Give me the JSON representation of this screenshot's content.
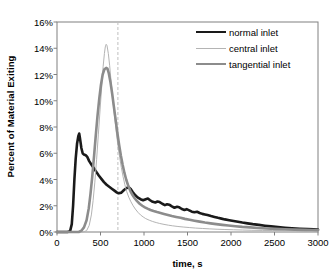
{
  "chart_data": {
    "type": "line",
    "title": "",
    "xlabel": "time, s",
    "ylabel": "Percent of Material Exiting",
    "xlim": [
      0,
      3000
    ],
    "ylim": [
      0,
      16
    ],
    "xticks": [
      "0",
      "500",
      "1000",
      "1500",
      "2000",
      "2500",
      "3000"
    ],
    "xtick_values": [
      0,
      500,
      1000,
      1500,
      2000,
      2500,
      3000
    ],
    "yticks": [
      "0%",
      "2%",
      "4%",
      "6%",
      "8%",
      "10%",
      "12%",
      "14%",
      "16%"
    ],
    "ytick_values": [
      0,
      2,
      4,
      6,
      8,
      10,
      12,
      14,
      16
    ],
    "grid": false,
    "legend_position": "upper-right",
    "annotations": [
      {
        "name": "reference-line",
        "type": "vertical-dashed-line",
        "x": 700,
        "color": "#bfbfbf"
      }
    ],
    "series": [
      {
        "name": "normal inlet",
        "color": "#1a1a1a",
        "width": 2.6,
        "points": [
          [
            0,
            0.0
          ],
          [
            120,
            0.0
          ],
          [
            150,
            0.05
          ],
          [
            170,
            0.6
          ],
          [
            185,
            2.0
          ],
          [
            200,
            4.0
          ],
          [
            215,
            5.6
          ],
          [
            230,
            6.7
          ],
          [
            245,
            7.3
          ],
          [
            255,
            7.5
          ],
          [
            265,
            7.1
          ],
          [
            280,
            6.4
          ],
          [
            295,
            6.0
          ],
          [
            310,
            5.9
          ],
          [
            330,
            5.85
          ],
          [
            350,
            5.7
          ],
          [
            370,
            5.4
          ],
          [
            395,
            5.15
          ],
          [
            420,
            4.9
          ],
          [
            450,
            4.6
          ],
          [
            480,
            4.3
          ],
          [
            510,
            4.05
          ],
          [
            540,
            3.8
          ],
          [
            570,
            3.6
          ],
          [
            600,
            3.45
          ],
          [
            630,
            3.3
          ],
          [
            660,
            3.15
          ],
          [
            690,
            3.0
          ],
          [
            710,
            2.95
          ],
          [
            740,
            3.0
          ],
          [
            770,
            3.2
          ],
          [
            800,
            3.35
          ],
          [
            825,
            3.4
          ],
          [
            845,
            3.3
          ],
          [
            870,
            3.05
          ],
          [
            900,
            2.8
          ],
          [
            930,
            2.62
          ],
          [
            960,
            2.5
          ],
          [
            990,
            2.42
          ],
          [
            1020,
            2.5
          ],
          [
            1045,
            2.55
          ],
          [
            1070,
            2.42
          ],
          [
            1100,
            2.3
          ],
          [
            1130,
            2.25
          ],
          [
            1155,
            2.32
          ],
          [
            1180,
            2.28
          ],
          [
            1210,
            2.15
          ],
          [
            1240,
            2.05
          ],
          [
            1265,
            2.12
          ],
          [
            1290,
            2.08
          ],
          [
            1320,
            1.95
          ],
          [
            1350,
            1.85
          ],
          [
            1380,
            1.92
          ],
          [
            1405,
            1.88
          ],
          [
            1435,
            1.75
          ],
          [
            1465,
            1.68
          ],
          [
            1490,
            1.74
          ],
          [
            1520,
            1.65
          ],
          [
            1550,
            1.55
          ],
          [
            1580,
            1.5
          ],
          [
            1610,
            1.54
          ],
          [
            1640,
            1.45
          ],
          [
            1670,
            1.38
          ],
          [
            1700,
            1.34
          ],
          [
            1730,
            1.3
          ],
          [
            1770,
            1.22
          ],
          [
            1810,
            1.15
          ],
          [
            1850,
            1.08
          ],
          [
            1890,
            1.02
          ],
          [
            1930,
            0.96
          ],
          [
            1980,
            0.9
          ],
          [
            2030,
            0.84
          ],
          [
            2080,
            0.78
          ],
          [
            2130,
            0.72
          ],
          [
            2190,
            0.66
          ],
          [
            2250,
            0.6
          ],
          [
            2320,
            0.54
          ],
          [
            2390,
            0.48
          ],
          [
            2460,
            0.43
          ],
          [
            2540,
            0.38
          ],
          [
            2620,
            0.33
          ],
          [
            2700,
            0.29
          ],
          [
            2790,
            0.25
          ],
          [
            2880,
            0.22
          ],
          [
            2950,
            0.2
          ],
          [
            3000,
            0.18
          ]
        ]
      },
      {
        "name": "central inlet",
        "color": "#b4b4b4",
        "width": 1.0,
        "points": [
          [
            0,
            0.0
          ],
          [
            300,
            0.0
          ],
          [
            340,
            0.1
          ],
          [
            370,
            0.5
          ],
          [
            395,
            1.3
          ],
          [
            415,
            2.4
          ],
          [
            435,
            3.8
          ],
          [
            455,
            5.5
          ],
          [
            475,
            7.4
          ],
          [
            495,
            9.3
          ],
          [
            515,
            11.2
          ],
          [
            530,
            12.6
          ],
          [
            545,
            13.6
          ],
          [
            555,
            14.1
          ],
          [
            565,
            14.3
          ],
          [
            575,
            14.2
          ],
          [
            590,
            13.6
          ],
          [
            605,
            12.7
          ],
          [
            620,
            11.6
          ],
          [
            640,
            10.2
          ],
          [
            660,
            8.9
          ],
          [
            680,
            7.7
          ],
          [
            700,
            6.6
          ],
          [
            720,
            5.7
          ],
          [
            740,
            4.9
          ],
          [
            760,
            4.2
          ],
          [
            780,
            3.6
          ],
          [
            800,
            3.1
          ],
          [
            825,
            2.65
          ],
          [
            850,
            2.3
          ],
          [
            875,
            2.0
          ],
          [
            900,
            1.75
          ],
          [
            930,
            1.5
          ],
          [
            960,
            1.3
          ],
          [
            990,
            1.15
          ],
          [
            1020,
            1.02
          ],
          [
            1060,
            0.9
          ],
          [
            1100,
            0.8
          ],
          [
            1140,
            0.72
          ],
          [
            1180,
            0.65
          ],
          [
            1230,
            0.58
          ],
          [
            1280,
            0.52
          ],
          [
            1330,
            0.47
          ],
          [
            1390,
            0.42
          ],
          [
            1450,
            0.38
          ],
          [
            1520,
            0.34
          ],
          [
            1590,
            0.3
          ],
          [
            1670,
            0.27
          ],
          [
            1750,
            0.24
          ],
          [
            1840,
            0.21
          ],
          [
            1930,
            0.19
          ],
          [
            2030,
            0.17
          ],
          [
            2130,
            0.15
          ],
          [
            2240,
            0.13
          ],
          [
            2360,
            0.12
          ],
          [
            2480,
            0.11
          ],
          [
            2620,
            0.1
          ],
          [
            2760,
            0.09
          ],
          [
            2880,
            0.08
          ],
          [
            3000,
            0.08
          ]
        ]
      },
      {
        "name": "tangential inlet",
        "color": "#8c8c8c",
        "width": 2.6,
        "points": [
          [
            0,
            0.0
          ],
          [
            250,
            0.0
          ],
          [
            280,
            0.1
          ],
          [
            310,
            0.35
          ],
          [
            340,
            0.9
          ],
          [
            365,
            1.8
          ],
          [
            385,
            2.9
          ],
          [
            405,
            4.2
          ],
          [
            425,
            5.7
          ],
          [
            445,
            7.3
          ],
          [
            465,
            8.8
          ],
          [
            485,
            10.1
          ],
          [
            505,
            11.2
          ],
          [
            525,
            12.0
          ],
          [
            545,
            12.4
          ],
          [
            565,
            12.5
          ],
          [
            580,
            12.45
          ],
          [
            595,
            12.1
          ],
          [
            615,
            11.4
          ],
          [
            635,
            10.5
          ],
          [
            655,
            9.5
          ],
          [
            675,
            8.5
          ],
          [
            695,
            7.5
          ],
          [
            715,
            6.6
          ],
          [
            735,
            5.8
          ],
          [
            755,
            5.1
          ],
          [
            775,
            4.5
          ],
          [
            795,
            4.0
          ],
          [
            820,
            3.5
          ],
          [
            845,
            3.1
          ],
          [
            870,
            2.8
          ],
          [
            895,
            2.55
          ],
          [
            920,
            2.35
          ],
          [
            950,
            2.15
          ],
          [
            980,
            2.0
          ],
          [
            1010,
            1.88
          ],
          [
            1040,
            1.78
          ],
          [
            1075,
            1.68
          ],
          [
            1110,
            1.6
          ],
          [
            1150,
            1.52
          ],
          [
            1190,
            1.45
          ],
          [
            1230,
            1.38
          ],
          [
            1275,
            1.3
          ],
          [
            1320,
            1.22
          ],
          [
            1370,
            1.15
          ],
          [
            1420,
            1.08
          ],
          [
            1470,
            1.0
          ],
          [
            1525,
            0.93
          ],
          [
            1580,
            0.86
          ],
          [
            1640,
            0.79
          ],
          [
            1700,
            0.72
          ],
          [
            1765,
            0.66
          ],
          [
            1830,
            0.6
          ],
          [
            1900,
            0.54
          ],
          [
            1970,
            0.49
          ],
          [
            2050,
            0.44
          ],
          [
            2130,
            0.39
          ],
          [
            2220,
            0.35
          ],
          [
            2310,
            0.31
          ],
          [
            2410,
            0.27
          ],
          [
            2510,
            0.24
          ],
          [
            2620,
            0.21
          ],
          [
            2730,
            0.18
          ],
          [
            2850,
            0.16
          ],
          [
            2930,
            0.15
          ],
          [
            3000,
            0.14
          ]
        ]
      }
    ]
  },
  "legend": {
    "items": [
      {
        "label": "normal inlet"
      },
      {
        "label": "central inlet"
      },
      {
        "label": "tangential inlet"
      }
    ]
  },
  "plot": {
    "axis_color": "#808080",
    "background": "#ffffff"
  }
}
